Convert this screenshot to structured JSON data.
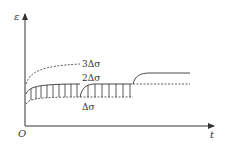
{
  "diagram": {
    "type": "strain-time creep diagram",
    "axes": {
      "y_label": "ε",
      "x_label": "t",
      "origin_label": "O"
    },
    "curves": [
      {
        "name": "3Δσ",
        "label": "3Δσ",
        "style": "dashed"
      },
      {
        "name": "2Δσ",
        "label": "2Δσ",
        "style": "solid"
      },
      {
        "name": "Δσ",
        "label": "Δσ",
        "style": "dashed"
      }
    ],
    "colors": {
      "line": "#333333",
      "background": "#ffffff"
    }
  }
}
